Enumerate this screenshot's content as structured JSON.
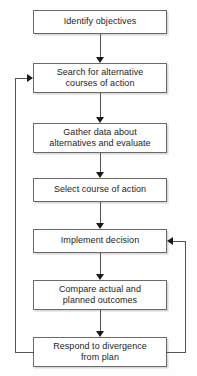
{
  "diagram": {
    "style": {
      "background": "#fefefe",
      "box_fill": "#ffffff",
      "box_border": "#6b6b6b",
      "box_shadow": "#d8d8d8",
      "connector": "#555555",
      "arrow": "#1a1a1a",
      "text": "#1d1d1d"
    },
    "nodes": [
      {
        "id": "identify-objectives",
        "label": "Identify objectives"
      },
      {
        "id": "search-alternatives",
        "label": "Search for alternative\ncourses of action"
      },
      {
        "id": "gather-data",
        "label": "Gather data about\nalternatives and evaluate"
      },
      {
        "id": "select-course",
        "label": "Select course of action"
      },
      {
        "id": "implement-decision",
        "label": "Implement decision"
      },
      {
        "id": "compare-outcomes",
        "label": "Compare actual and\nplanned outcomes"
      },
      {
        "id": "respond-divergence",
        "label": "Respond to divergence\nfrom plan"
      }
    ],
    "edges": [
      {
        "id": "e1",
        "from": "identify-objectives",
        "to": "search-alternatives",
        "kind": "down"
      },
      {
        "id": "e2",
        "from": "search-alternatives",
        "to": "gather-data",
        "kind": "down"
      },
      {
        "id": "e3",
        "from": "gather-data",
        "to": "select-course",
        "kind": "down"
      },
      {
        "id": "e4",
        "from": "select-course",
        "to": "implement-decision",
        "kind": "down"
      },
      {
        "id": "e5",
        "from": "implement-decision",
        "to": "compare-outcomes",
        "kind": "down"
      },
      {
        "id": "e6",
        "from": "compare-outcomes",
        "to": "respond-divergence",
        "kind": "down"
      },
      {
        "id": "e7",
        "from": "respond-divergence",
        "to": "search-alternatives",
        "kind": "feedback-left"
      },
      {
        "id": "e8",
        "from": "respond-divergence",
        "to": "implement-decision",
        "kind": "feedback-right"
      }
    ]
  }
}
